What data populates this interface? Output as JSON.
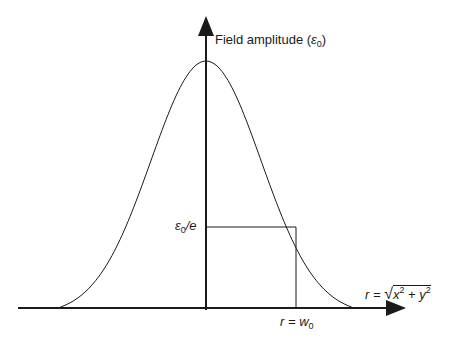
{
  "diagram": {
    "y_axis_label": "Field amplitude (",
    "y_axis_unit_symbol": "ε",
    "y_axis_unit_sub": "0",
    "y_axis_label_close": ")",
    "level_label_symbol": "ε",
    "level_label_sub": "0",
    "level_label_rest": "/e",
    "x_marker_label_r": "r = ",
    "x_marker_label_w": "w",
    "x_marker_label_sub": "0",
    "x_axis_label_lhs": "r = ",
    "x_axis_label_x": "x",
    "x_axis_label_y": "y",
    "x_axis_label_exp": "2",
    "x_axis_label_plus": " + ",
    "curve": "Gaussian beam profile",
    "colors": {
      "stroke": "#1a1a1a",
      "background": "#ffffff"
    }
  }
}
